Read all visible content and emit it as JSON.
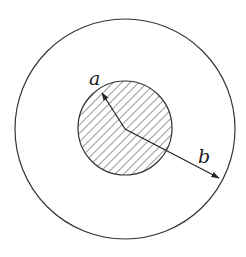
{
  "diagram": {
    "type": "concentric-circles",
    "outer_circle": {
      "cx": 125,
      "cy": 129,
      "r": 110
    },
    "inner_circle": {
      "cx": 125,
      "cy": 128,
      "r": 47,
      "fill": "hatched"
    },
    "radius_a": {
      "label": "a",
      "from": [
        125,
        129
      ],
      "to": [
        102,
        93
      ],
      "label_pos": [
        90,
        84
      ]
    },
    "radius_b": {
      "label": "b",
      "from": [
        125,
        129
      ],
      "to": [
        219,
        178
      ],
      "label_pos": [
        199,
        163
      ]
    },
    "stroke_color": "#333333"
  }
}
